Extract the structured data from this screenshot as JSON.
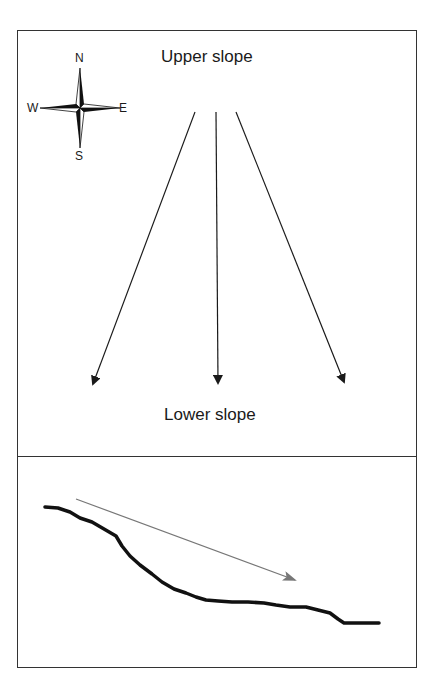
{
  "diagram": {
    "top_panel": {
      "upper_label": "Upper slope",
      "lower_label": "Lower slope",
      "compass": {
        "north": "N",
        "south": "S",
        "west": "W",
        "east": "E",
        "icon": "compass-rose-icon"
      },
      "flow_arrows": [
        {
          "from": [
            195,
            112
          ],
          "to": [
            93,
            384
          ]
        },
        {
          "from": [
            216,
            112
          ],
          "to": [
            218,
            383
          ]
        },
        {
          "from": [
            236,
            112
          ],
          "to": [
            344,
            382
          ]
        }
      ]
    },
    "bottom_panel": {
      "profile_curve": "slope-cross-section",
      "direction_arrow": {
        "from": [
          76,
          499
        ],
        "to": [
          295,
          580
        ],
        "color": "#777777"
      }
    },
    "colors": {
      "line": "#1a1a1a",
      "frame": "#333333",
      "arrow_gray": "#777777"
    }
  }
}
